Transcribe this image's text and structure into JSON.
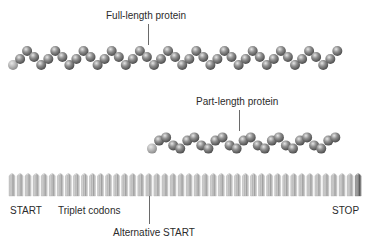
{
  "labels": {
    "full_length": "Full-length protein",
    "part_length": "Part-length protein",
    "start": "START",
    "triplet_codons": "Triplet codons",
    "alternative_start": "Alternative START",
    "stop": "STOP"
  },
  "colors": {
    "bead_dark": "#5e5e5e",
    "bead_light": "#d8d8d8",
    "first_bead": "#a9a9a9",
    "codon_fill": "#cfcfcf",
    "codon_line": "#9a9a9a",
    "stop_codon": "#7a7a7a",
    "leader_line": "#6a6a6a"
  },
  "proteins": [
    {
      "name": "full-length-protein",
      "x_start": 13,
      "peak_y": 50,
      "valley_y": 66,
      "period": 28.2,
      "first_peak_x": 28,
      "bead_count": 47,
      "bead_radius": 5
    },
    {
      "name": "part-length-protein",
      "x_start": 152,
      "peak_y": 135,
      "valley_y": 151,
      "period": 28.2,
      "first_peak_x": 164,
      "bead_count": 27,
      "bead_radius": 5
    }
  ],
  "codons": {
    "x_start": 9,
    "spacing": 8.05,
    "count": 44,
    "top": 172,
    "bottom": 196,
    "width": 6
  }
}
